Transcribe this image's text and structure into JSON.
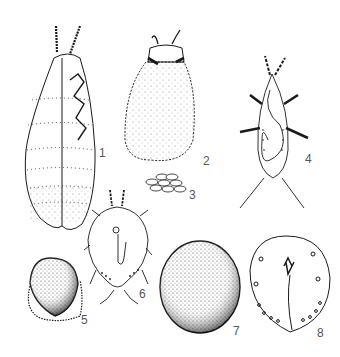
{
  "plate": {
    "background": "#ffffff",
    "ink_color": "#1a1a1a",
    "label_color": "#555555",
    "figures": [
      {
        "id": 1,
        "label": "1",
        "subject": "elongate-female-lateral-view"
      },
      {
        "id": 2,
        "label": "2",
        "subject": "hairy-waxy-female"
      },
      {
        "id": 3,
        "label": "3",
        "subject": "egg-cluster"
      },
      {
        "id": 4,
        "label": "4",
        "subject": "crawler-larva-ventral"
      },
      {
        "id": 5,
        "label": "5",
        "subject": "scale-with-wax-fringe"
      },
      {
        "id": 6,
        "label": "6",
        "subject": "nymph-ventral-with-legs"
      },
      {
        "id": 7,
        "label": "7",
        "subject": "stippled-oval-scale"
      },
      {
        "id": 8,
        "label": "8",
        "subject": "adult-female-ventral-outline"
      }
    ]
  }
}
